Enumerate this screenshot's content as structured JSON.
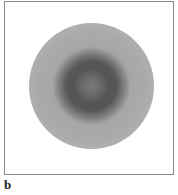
{
  "figure": {
    "panel_label": "b",
    "content": "concentric-ring-disc",
    "colors": {
      "background": "#ffffff",
      "frame_border": "#8a8a8a",
      "outer_ring": "#4e4e4e",
      "bright_ring": "#cfcfcf",
      "mid_band": "#aaaaaa",
      "inner_dark_ring": "#555555",
      "center": "#7a7a7a"
    }
  }
}
